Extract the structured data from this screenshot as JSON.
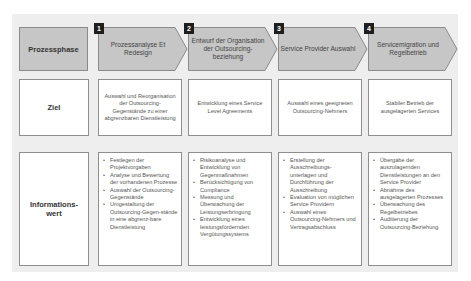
{
  "diagram": {
    "rows": {
      "phase": "Prozessphase",
      "goal": "Ziel",
      "info": "Informations-\nwert"
    },
    "phases": [
      {
        "number": "1",
        "title": "Prozessanalyse Et Redesign",
        "goal": "Auswahl und Reorganisation der Outsourcing-Gegenstände zu einer abgrenzbaren Dienstleistung",
        "info": [
          "Festlegen der Projektvorgaben",
          "Analyse und Bewertung der vorhandenen Prozesse",
          "Auswahl der Outsourcing-Gegenstände",
          "Umgestaltung der Outsourcing-Gegen-stände in eine abgrenz-bare Dienstleistung"
        ]
      },
      {
        "number": "2",
        "title": "Entwurf der Organisation der Outsourcing-beziehung",
        "goal": "Entwicklung eines Service Level Agreements",
        "info": [
          "Risikoanalyse und Entwicklung von Gegenmaßnahmen",
          "Berücksichtigung von Compliance",
          "Messung und Überwachung der Leistungserbringung",
          "Entwicklung eines leistungsfördernden Vergütungssystems"
        ]
      },
      {
        "number": "3",
        "title": "Service Provider Auswahl",
        "goal": "Auswahl eines geeigneten Outsourcing-Nehmers",
        "info": [
          "Erstellung der Ausschreibungs-unterlagen und Durchführung der Ausschreibung",
          "Evaluation von möglichen Service Providern",
          "Auswahl eines Outsourcing-Nehmers und Vertragsabschluss"
        ]
      },
      {
        "number": "4",
        "title": "Servicemigration und Regelbetrieb",
        "goal": "Stabiler Betrieb der ausgelagerten Services",
        "info": [
          "Übergabe der auszulagernden Dienstleistungen an den Service Provider",
          "Abnahme des ausgelagerten Prozesses",
          "Überwachung des Regelbetriebes",
          "Auditierung der Outsourcing-Beziehung"
        ]
      }
    ],
    "colors": {
      "panel": "#eeeeee",
      "phase_fill": "#c6c6c6",
      "border": "#8e8e8e",
      "number_badge": "#1e1e1e"
    }
  }
}
